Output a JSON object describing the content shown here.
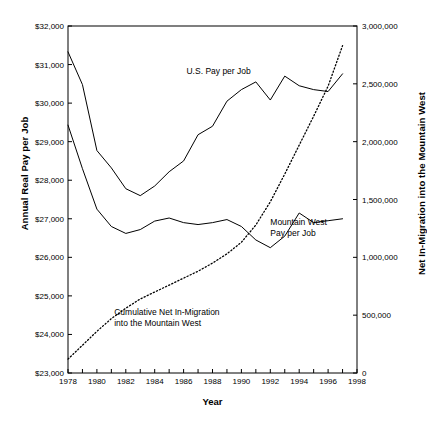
{
  "chart_data": {
    "type": "line",
    "title": "",
    "xlabel": "Year",
    "ylabel": "Annual Real Pay per Job",
    "ylabel_right": "Net In-Migration into the Mountain West",
    "xlim": [
      1978,
      1998
    ],
    "ylim": [
      23000,
      32000
    ],
    "ylim_right": [
      0,
      3000000
    ],
    "grid": false,
    "legend_position": "inline-annotations",
    "x": [
      1978,
      1979,
      1980,
      1981,
      1982,
      1983,
      1984,
      1985,
      1986,
      1987,
      1988,
      1989,
      1990,
      1991,
      1992,
      1993,
      1994,
      1995,
      1996,
      1997
    ],
    "yticks_left": [
      "$23,000",
      "$24,000",
      "$25,000",
      "$26,000",
      "$27,000",
      "$28,000",
      "$29,000",
      "$30,000",
      "$31,000",
      "$32,000"
    ],
    "yticks_right": [
      "0",
      "500,000",
      "1,000,000",
      "1,500,000",
      "2,000,000",
      "2,500,000",
      "3,000,000"
    ],
    "xticks": [
      "1978",
      "1980",
      "1982",
      "1984",
      "1986",
      "1988",
      "1990",
      "1992",
      "1994",
      "1996",
      "1998"
    ],
    "series": [
      {
        "name": "U.S. Pay per Job",
        "axis": "left",
        "style": "solid",
        "values": [
          31330,
          30480,
          28770,
          28320,
          27780,
          27600,
          27850,
          28220,
          28500,
          29180,
          29400,
          30050,
          30350,
          30550,
          30080,
          30700,
          30450,
          30350,
          30300,
          30760
        ]
      },
      {
        "name": "Mountain West Pay per Job",
        "axis": "left",
        "style": "solid",
        "values": [
          29430,
          28300,
          27250,
          26800,
          26620,
          26720,
          26940,
          27020,
          26900,
          26850,
          26900,
          26980,
          26800,
          26450,
          26250,
          26550,
          27150,
          26900,
          26950,
          27000
        ]
      },
      {
        "name": "Cumulative Net In-Migration into the Mountain West",
        "axis": "right",
        "style": "dotted",
        "values": [
          120000,
          240000,
          360000,
          470000,
          560000,
          640000,
          700000,
          760000,
          820000,
          880000,
          950000,
          1030000,
          1130000,
          1280000,
          1480000,
          1720000,
          1970000,
          2220000,
          2480000,
          2830000
        ]
      }
    ],
    "annotations": [
      {
        "text": "U.S. Pay per Job",
        "x": 1986.2,
        "y": 30800
      },
      {
        "text": "Mountain West\nPay per Job",
        "x": 1992.0,
        "y": 26900
      },
      {
        "text": "Cumulative Net In-Migration\ninto the Mountain West",
        "x": 1981.2,
        "y": 24550
      }
    ]
  },
  "caption": {
    "text": ""
  }
}
